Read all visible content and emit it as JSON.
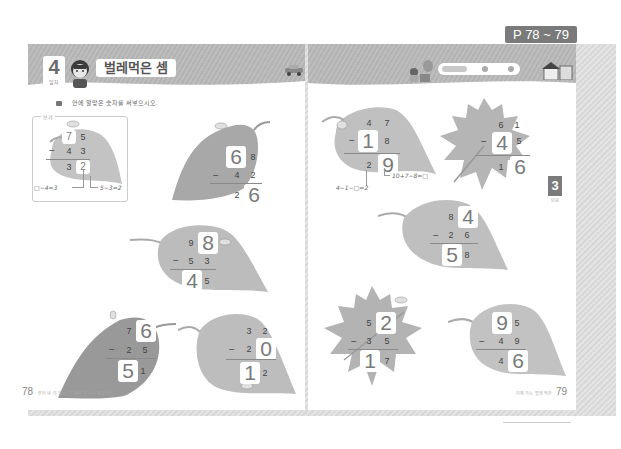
{
  "page_range_tag": "P 78 ~ 79",
  "left_page": {
    "lesson_number": "4",
    "lesson_sub": "일차",
    "title": "벌레먹은 셈",
    "instruction": "안에 알맞은 숫자를 써넣으시오.",
    "example_label": "보기",
    "page_number": "78",
    "footer_text": "받아 내 려 있는 (두 자리 수)-(두 자리 수)",
    "example": {
      "top": [
        "7",
        "5"
      ],
      "sub": [
        "4",
        "3"
      ],
      "result": [
        "3",
        "2"
      ],
      "boxed": [
        "top.0",
        "result.1"
      ],
      "hint_left": "□−4=3",
      "hint_right": "5−3=2"
    },
    "problems": [
      {
        "id": "L1",
        "top": [
          "6",
          "8"
        ],
        "sub": [
          "4",
          "2"
        ],
        "result": [
          "2",
          "6"
        ],
        "boxed": [
          "top.0",
          "result.1"
        ]
      },
      {
        "id": "L2",
        "top": [
          "9",
          "8"
        ],
        "sub": [
          "5",
          "3"
        ],
        "result": [
          "4",
          "5"
        ],
        "boxed": [
          "top.1",
          "result.0"
        ]
      },
      {
        "id": "L3",
        "top": [
          "7",
          "6"
        ],
        "sub": [
          "2",
          "5"
        ],
        "result": [
          "5",
          "1"
        ],
        "boxed": [
          "top.1",
          "result.0"
        ]
      },
      {
        "id": "L4",
        "top": [
          "3",
          "2"
        ],
        "sub": [
          "2",
          "0"
        ],
        "result": [
          "1",
          "2"
        ],
        "boxed": [
          "sub.1",
          "result.0"
        ]
      }
    ]
  },
  "right_page": {
    "page_number": "79",
    "footer_text": "이해 가는 벌레 먹은",
    "chapter_tab": "3",
    "chapter_sub": "단원",
    "problems": [
      {
        "id": "R1",
        "top": [
          "4",
          "7"
        ],
        "sub": [
          "1",
          "8"
        ],
        "result": [
          "2",
          "9"
        ],
        "boxed": [
          "sub.0",
          "result.1"
        ],
        "hint_left": "4−1−□=2",
        "hint_right": "10+7−8=□"
      },
      {
        "id": "R2",
        "top": [
          "6",
          "1"
        ],
        "sub": [
          "4",
          "5"
        ],
        "result": [
          "1",
          "6"
        ],
        "boxed": [
          "sub.0",
          "result.1"
        ]
      },
      {
        "id": "R3",
        "top": [
          "8",
          "4"
        ],
        "sub": [
          "2",
          "6"
        ],
        "result": [
          "5",
          "8"
        ],
        "boxed": [
          "top.1",
          "result.0"
        ]
      },
      {
        "id": "R4",
        "top": [
          "5",
          "2"
        ],
        "sub": [
          "3",
          "5"
        ],
        "result": [
          "1",
          "7"
        ],
        "boxed": [
          "top.1",
          "result.0"
        ]
      },
      {
        "id": "R5",
        "top": [
          "9",
          "5"
        ],
        "sub": [
          "4",
          "9"
        ],
        "result": [
          "4",
          "6"
        ],
        "boxed": [
          "top.0",
          "result.1"
        ]
      }
    ]
  },
  "icons": {
    "bullet": "list-bullet-icon",
    "avatar": "child-avatar-icon",
    "car": "car-icon",
    "house": "house-icon",
    "bug": "caterpillar-icon"
  },
  "colors": {
    "header_band": "#b8b8b8",
    "page_tag": "#7a7a7a",
    "leaf_light": "#c9c9c9",
    "leaf_dark": "#9e9e9e"
  }
}
